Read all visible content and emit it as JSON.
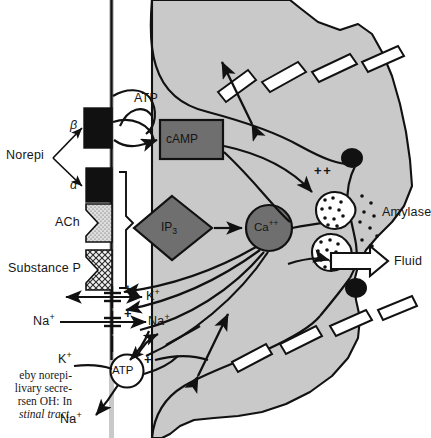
{
  "figure": {
    "cell_fill": "#c9c9c9",
    "outline": "#111111",
    "organelle_fill": "#6f6f6f",
    "vesicle_fill": "#ffffff",
    "granule_fill": "#111111"
  },
  "ligands": {
    "norepi": "Norepi",
    "beta": "β",
    "alpha": "α",
    "ach": "ACh",
    "substance_p": "Substance P"
  },
  "receptors": [
    {
      "name": "beta-adrenergic-receptor",
      "fill": "#111111"
    },
    {
      "name": "alpha-adrenergic-receptor",
      "fill": "#111111"
    },
    {
      "name": "acetylcholine-receptor",
      "fill": "#d8d8d8"
    },
    {
      "name": "substance-p-receptor",
      "fill": "#e8e8e8"
    }
  ],
  "messengers": {
    "atp_top": "ATP",
    "camp": "cAMP",
    "ip3": "IP",
    "ip3_sub": "3",
    "ca": "Ca",
    "ca_sup": "++",
    "atp_bottom": "ATP"
  },
  "ions": {
    "k_in": "K",
    "k_sup": "+",
    "na_out": "Na",
    "na_sup": "+",
    "na_in": "Na",
    "k_bottom": "K",
    "na_bottom": "Na"
  },
  "outputs": {
    "amylase": "Amylase",
    "fluid": "Fluid"
  },
  "signs": {
    "plus": "+",
    "double_plus": "+ +"
  },
  "caption": {
    "line1": "eby norepi-",
    "line2": "livary secre-",
    "line3": "rsen OH: In",
    "line4": "stinal tract,"
  }
}
